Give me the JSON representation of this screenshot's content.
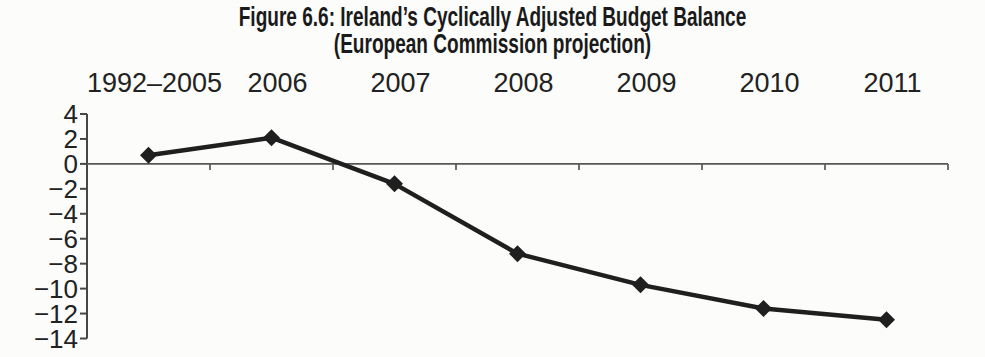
{
  "figure": {
    "title_line1": "Figure 6.6: Ireland’s Cyclically Adjusted Budget Balance",
    "title_line2": "(European Commission projection)"
  },
  "chart_data": {
    "type": "line",
    "title": "Figure 6.6: Ireland’s Cyclically Adjusted Budget Balance",
    "subtitle": "(European Commission projection)",
    "categories": [
      "1992–2005",
      "2006",
      "2007",
      "2008",
      "2009",
      "2010",
      "2011"
    ],
    "values": [
      0.7,
      2.1,
      -1.6,
      -7.2,
      -9.7,
      -11.6,
      -12.5
    ],
    "xlabel": "",
    "ylabel": "",
    "ylim": [
      -14,
      4
    ],
    "yticks": [
      4,
      2,
      0,
      -2,
      -4,
      -6,
      -8,
      -10,
      -12,
      -14
    ],
    "x_axis_labels_position": "top",
    "zero_baseline": true,
    "grid": false,
    "legend": false,
    "marker": "diamond",
    "line_color": "#1f1f1f",
    "axis_color": "#474747",
    "baseline_color": "#575757",
    "label_color": "#222222",
    "background_color": "#fcfcfa"
  }
}
